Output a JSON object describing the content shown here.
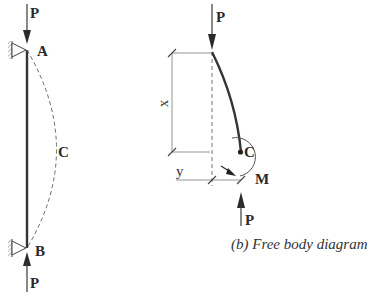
{
  "diagram": {
    "type": "column buckling (pin-ended) with free body diagram",
    "left_figure": {
      "load_top_label": "P",
      "support_top_label": "A",
      "deflected_midpoint_label": "C",
      "support_bottom_label": "B",
      "load_bottom_label": "P"
    },
    "right_figure": {
      "load_top_label": "P",
      "dimension_x_label": "x",
      "dimension_y_label": "y",
      "section_point_label": "C",
      "moment_label": "M",
      "load_bottom_label": "P",
      "caption": "(b) Free body diagram"
    },
    "colors": {
      "line": "#3a3a3a",
      "dashed": "#6a6a6a",
      "dimension": "#888888",
      "background": "#ffffff"
    }
  }
}
